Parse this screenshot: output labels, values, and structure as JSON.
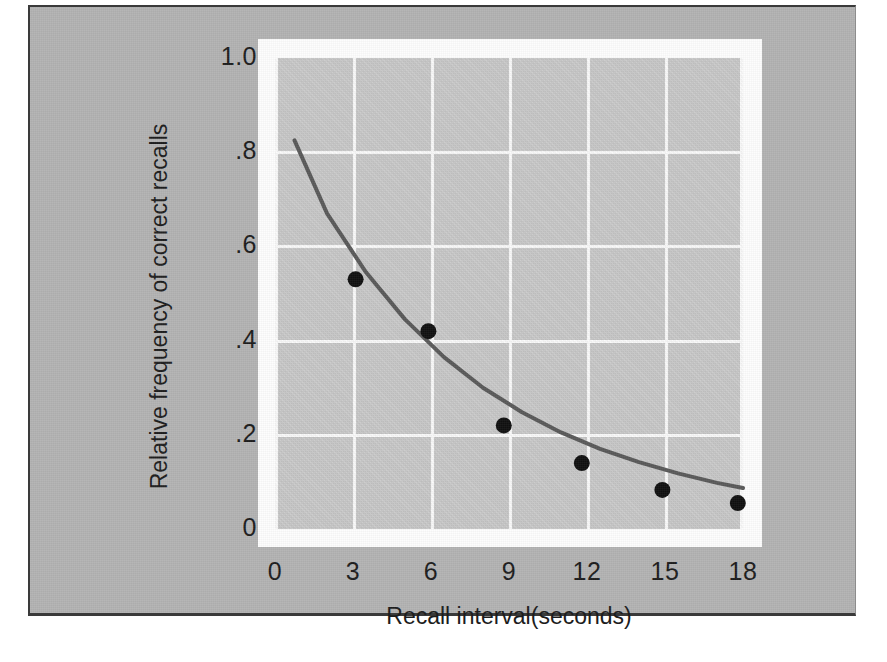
{
  "figure": {
    "background_color": "#ffffff",
    "plate_color": "#b3b3b3",
    "mat_color": "#fdfdfd",
    "plot_bg_color": "#c9c9c9",
    "grid_color": "#fbfbfb",
    "curve_color": "#5a5a5a",
    "point_color": "#111111",
    "text_color": "#1d1d1d"
  },
  "chart_data": {
    "type": "scatter",
    "title": "",
    "xlabel": "Recall interval(seconds)",
    "ylabel": "Relative frequency of correct recalls",
    "xlim": [
      0,
      18
    ],
    "ylim": [
      0,
      1.0
    ],
    "grid": true,
    "legend": "none",
    "xticks": [
      0,
      3,
      6,
      9,
      12,
      15,
      18
    ],
    "xtick_labels": [
      "0",
      "3",
      "6",
      "9",
      "12",
      "15",
      "18"
    ],
    "yticks": [
      0,
      0.2,
      0.4,
      0.6,
      0.8,
      1.0
    ],
    "ytick_labels": [
      "0",
      ".2",
      ".4",
      ".6",
      ".8",
      "1.0"
    ],
    "x": [
      3.1,
      5.9,
      8.8,
      11.8,
      14.9,
      17.8
    ],
    "values": [
      0.53,
      0.42,
      0.22,
      0.14,
      0.083,
      0.055
    ],
    "series": [
      {
        "name": "Observed recall",
        "marker": "filled-circle",
        "x": [
          3.1,
          5.9,
          8.8,
          11.8,
          14.9,
          17.8
        ],
        "values": [
          0.53,
          0.42,
          0.22,
          0.14,
          0.083,
          0.055
        ]
      },
      {
        "name": "Fitted forgetting curve",
        "marker": "none",
        "line": "solid",
        "x": [
          0.75,
          2.0,
          3.5,
          5.0,
          6.5,
          8.0,
          9.5,
          11.0,
          12.5,
          14.0,
          15.5,
          17.0,
          18.0
        ],
        "values": [
          0.825,
          0.67,
          0.545,
          0.445,
          0.365,
          0.3,
          0.248,
          0.205,
          0.17,
          0.142,
          0.118,
          0.098,
          0.087
        ]
      }
    ]
  }
}
